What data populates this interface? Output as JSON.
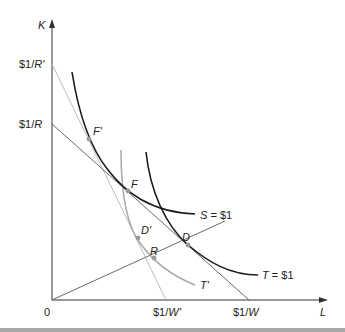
{
  "diagram": {
    "type": "isoquant-isocost",
    "axes": {
      "y_label": "K",
      "x_label": "L",
      "origin_label": "0"
    },
    "y_intercepts": [
      {
        "label_prefix": "$1/",
        "label_var": "R'"
      },
      {
        "label_prefix": "$1/",
        "label_var": "R"
      }
    ],
    "x_intercepts": [
      {
        "label_prefix": "$1/",
        "label_var": "W'"
      },
      {
        "label_prefix": "$1/",
        "label_var": "W"
      }
    ],
    "curves": {
      "S": {
        "name": "S",
        "value": " = $1",
        "color": "#1a1a1a"
      },
      "T": {
        "name": "T",
        "value": " = $1",
        "color": "#1a1a1a"
      },
      "T_prime": {
        "name": "T'",
        "color": "#a8a8a8"
      }
    },
    "points": {
      "F_prime": "F'",
      "F": "F",
      "D_prime": "D'",
      "D": "D",
      "R": "R"
    },
    "colors": {
      "dark_line": "#1a1a1a",
      "mid_line": "#6a6a6a",
      "light_line": "#b8b8b8",
      "point_fill": "#9a9a9a",
      "bottom_bar": "#a8a8a8"
    }
  }
}
